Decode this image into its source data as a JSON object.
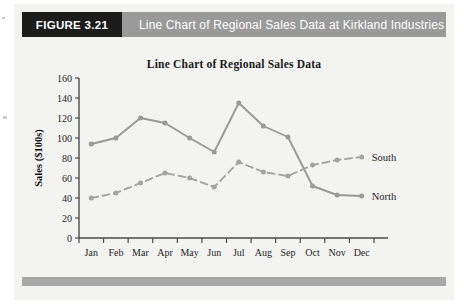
{
  "banner": {
    "figure_tag": "FIGURE 3.21",
    "title": "Line Chart of Regional Sales Data at Kirkland Industries"
  },
  "chart_data": {
    "type": "line",
    "title": "Line Chart of Regional Sales Data",
    "xlabel": "",
    "ylabel": "Sales ($100s)",
    "categories": [
      "Jan",
      "Feb",
      "Mar",
      "Apr",
      "May",
      "Jun",
      "Jul",
      "Aug",
      "Sep",
      "Oct",
      "Nov",
      "Dec"
    ],
    "ylim": [
      0,
      160
    ],
    "yticks": [
      0,
      20,
      40,
      60,
      80,
      100,
      120,
      140,
      160
    ],
    "grid": false,
    "legend_position": "right-inline-end-labels",
    "series": [
      {
        "name": "North",
        "style": "solid",
        "color": "#999999",
        "values": [
          94,
          100,
          120,
          115,
          100,
          86,
          135,
          112,
          101,
          52,
          43,
          42
        ]
      },
      {
        "name": "South",
        "style": "dashed",
        "color": "#a3a3a3",
        "values": [
          40,
          45,
          55,
          65,
          60,
          51,
          76,
          66,
          62,
          73,
          78,
          81
        ]
      }
    ]
  },
  "colors": {
    "banner_tag_bg": "#1c1c1c",
    "banner_bg": "#9a9a9a",
    "paper_bg": "#f3f3f1",
    "axis": "#4a4a4a",
    "footer_rule": "#a8a8a8"
  }
}
